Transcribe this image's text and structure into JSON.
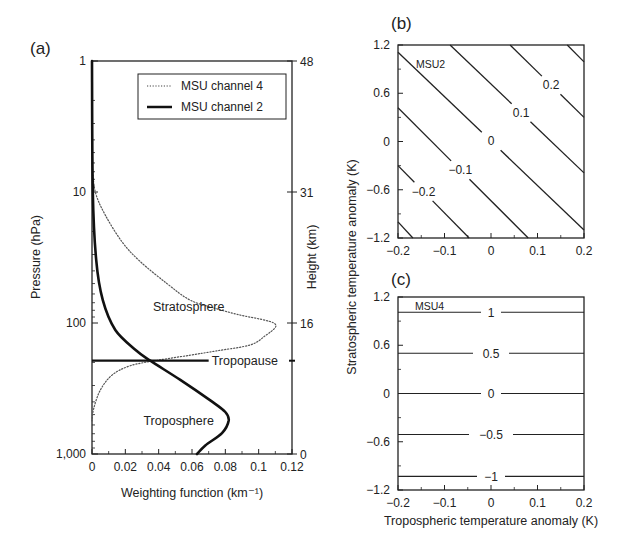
{
  "chart_data": [
    {
      "panel": "a",
      "type": "line",
      "panel_label": "(a)",
      "title": "",
      "xlabel": "Weighting function (km⁻¹)",
      "ylabel": "Pressure (hPa)",
      "y2label": "Height (km)",
      "xlim": [
        0,
        0.12
      ],
      "ylim": [
        1000,
        1
      ],
      "yscale": "log",
      "x_ticks": [
        0,
        0.02,
        0.04,
        0.06,
        0.08,
        0.1,
        0.12
      ],
      "x_tick_labels": [
        "0",
        "0.02",
        "0.04",
        "0.06",
        "0.08",
        "0.1",
        "0.12"
      ],
      "y_ticks": [
        1,
        10,
        100,
        1000
      ],
      "y_tick_labels": [
        "1",
        "10",
        "100",
        "1,000"
      ],
      "y2_ticks": [
        {
          "pressure": 1,
          "label": "48"
        },
        {
          "pressure": 10,
          "label": "31"
        },
        {
          "pressure": 100,
          "label": "16"
        },
        {
          "pressure": 1000,
          "label": "0"
        }
      ],
      "legend": {
        "placement": "top-right",
        "entries": [
          "MSU channel 4",
          "MSU channel 2"
        ]
      },
      "series": [
        {
          "name": "MSU channel 4",
          "style": "dotted",
          "points": [
            {
              "w": 0.0,
              "p": 6
            },
            {
              "w": 0.002,
              "p": 10
            },
            {
              "w": 0.008,
              "p": 15
            },
            {
              "w": 0.018,
              "p": 24
            },
            {
              "w": 0.029,
              "p": 34
            },
            {
              "w": 0.045,
              "p": 50
            },
            {
              "w": 0.059,
              "p": 67
            },
            {
              "w": 0.075,
              "p": 78
            },
            {
              "w": 0.089,
              "p": 87
            },
            {
              "w": 0.102,
              "p": 94
            },
            {
              "w": 0.109,
              "p": 100
            },
            {
              "w": 0.11,
              "p": 108
            },
            {
              "w": 0.104,
              "p": 125
            },
            {
              "w": 0.095,
              "p": 147
            },
            {
              "w": 0.075,
              "p": 163
            },
            {
              "w": 0.059,
              "p": 176
            },
            {
              "w": 0.04,
              "p": 192
            },
            {
              "w": 0.023,
              "p": 212
            },
            {
              "w": 0.012,
              "p": 250
            },
            {
              "w": 0.005,
              "p": 325
            },
            {
              "w": 0.001,
              "p": 450
            },
            {
              "w": 0.0,
              "p": 560
            }
          ]
        },
        {
          "name": "MSU channel 2",
          "style": "solid",
          "points": [
            {
              "w": 0.0,
              "p": 1
            },
            {
              "w": 0.0005,
              "p": 10
            },
            {
              "w": 0.0025,
              "p": 33
            },
            {
              "w": 0.0065,
              "p": 67
            },
            {
              "w": 0.014,
              "p": 113
            },
            {
              "w": 0.026,
              "p": 160
            },
            {
              "w": 0.035,
              "p": 194
            },
            {
              "w": 0.053,
              "p": 272
            },
            {
              "w": 0.071,
              "p": 390
            },
            {
              "w": 0.08,
              "p": 478
            },
            {
              "w": 0.082,
              "p": 555
            },
            {
              "w": 0.078,
              "p": 693
            },
            {
              "w": 0.068,
              "p": 860
            },
            {
              "w": 0.063,
              "p": 1000
            }
          ]
        }
      ],
      "reference_lines": [
        {
          "label": "Tropopause",
          "pressure": 194,
          "x_end": 0.07
        }
      ],
      "annotations": [
        {
          "text": "Stratosphere",
          "w": 0.058,
          "p": 75
        },
        {
          "text": "Troposphere",
          "w": 0.052,
          "p": 560
        }
      ]
    },
    {
      "panel": "b",
      "type": "contour",
      "panel_label": "(b)",
      "annotation": "MSU2",
      "xlabel": "",
      "ylabel": "",
      "xlim": [
        -0.2,
        0.2
      ],
      "ylim": [
        -1.2,
        1.2
      ],
      "x_ticks": [
        -0.2,
        -0.1,
        0,
        0.1,
        0.2
      ],
      "x_tick_labels": [
        "−0.2",
        "−0.1",
        "0",
        "0.1",
        "0.2"
      ],
      "y_ticks": [
        -1.2,
        -0.6,
        0,
        0.6,
        1.2
      ],
      "y_tick_labels": [
        "−1.2",
        "−0.6",
        "0",
        "0.6",
        "1.2"
      ],
      "contours": [
        {
          "level": -0.3,
          "label": "",
          "from": [
            -0.2,
            -1.0
          ],
          "to": [
            -0.168,
            -1.2
          ]
        },
        {
          "level": -0.2,
          "label": "−0.2",
          "from": [
            -0.2,
            -0.3
          ],
          "to": [
            -0.047,
            -1.2
          ],
          "label_at": [
            -0.15,
            -0.65
          ]
        },
        {
          "level": -0.1,
          "label": "−0.1",
          "from": [
            -0.2,
            0.42
          ],
          "to": [
            0.08,
            -1.2
          ],
          "label_at": [
            -0.06,
            -0.32
          ]
        },
        {
          "level": 0,
          "label": "0",
          "from": [
            -0.2,
            1.11
          ],
          "to": [
            0.2,
            -1.1
          ],
          "label_at": [
            0.0,
            0.0
          ]
        },
        {
          "level": 0.1,
          "label": "0.1",
          "from": [
            -0.088,
            1.2
          ],
          "to": [
            0.2,
            -0.39
          ],
          "label_at": [
            0.075,
            0.42
          ]
        },
        {
          "level": 0.2,
          "label": "0.2",
          "from": [
            0.041,
            1.2
          ],
          "to": [
            0.2,
            0.3
          ],
          "label_at": [
            0.148,
            0.81
          ]
        },
        {
          "level": 0.3,
          "label": "",
          "from": [
            0.164,
            1.2
          ],
          "to": [
            0.2,
            0.99
          ]
        }
      ]
    },
    {
      "panel": "c",
      "type": "contour",
      "panel_label": "(c)",
      "annotation": "MSU4",
      "xlabel": "Tropospheric temperature anomaly (K)",
      "ylabel": "",
      "xlim": [
        -0.2,
        0.2
      ],
      "ylim": [
        -1.2,
        1.2
      ],
      "x_ticks": [
        -0.2,
        -0.1,
        0,
        0.1,
        0.2
      ],
      "x_tick_labels": [
        "−0.2",
        "−0.1",
        "0",
        "0.1",
        "0.2"
      ],
      "y_ticks": [
        -1.2,
        -0.6,
        0,
        0.6,
        1.2
      ],
      "y_tick_labels": [
        "−1.2",
        "−0.6",
        "0",
        "0.6",
        "1.2"
      ],
      "contours": [
        {
          "level": 1,
          "label": "1",
          "y": 1.01
        },
        {
          "level": 0.5,
          "label": "0.5",
          "y": 0.5
        },
        {
          "level": 0,
          "label": "0",
          "y": 0.0
        },
        {
          "level": -0.5,
          "label": "−0.5",
          "y": -0.51
        },
        {
          "level": -1,
          "label": "−1",
          "y": -1.03
        }
      ]
    }
  ],
  "shared_ylabel_bc": "Stratospheric temperature anomaly (K)"
}
